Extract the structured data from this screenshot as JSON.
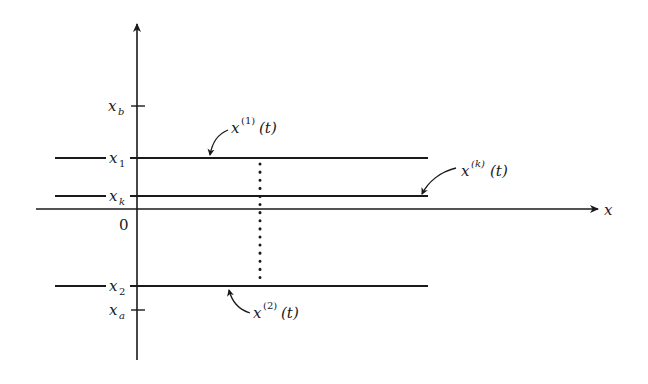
{
  "figure": {
    "axes": {
      "horizontal_label": "x",
      "origin_label": "0"
    },
    "levels": [
      {
        "id": "xb",
        "base": "x",
        "sub": "b",
        "kind": "tick"
      },
      {
        "id": "x1",
        "base": "x",
        "sub": "1",
        "kind": "trajectory"
      },
      {
        "id": "xk",
        "base": "x",
        "sub": "k",
        "kind": "trajectory"
      },
      {
        "id": "x2",
        "base": "x",
        "sub": "2",
        "kind": "trajectory"
      },
      {
        "id": "xa",
        "base": "x",
        "sub": "a",
        "kind": "tick"
      }
    ],
    "curve_labels": [
      {
        "id": "x1t",
        "base": "x",
        "sup": "(1)",
        "arg": "(t)"
      },
      {
        "id": "xkt",
        "base": "x",
        "sup": "(k)",
        "arg": "(t)"
      },
      {
        "id": "x2t",
        "base": "x",
        "sup": "(2)",
        "arg": "(t)"
      }
    ],
    "colors": {
      "ink": "#1a1a1a",
      "background": "#ffffff"
    }
  }
}
